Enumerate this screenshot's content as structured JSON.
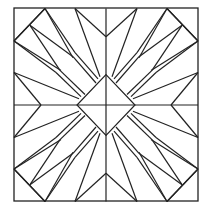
{
  "diagram": {
    "title": "",
    "stroke_color": "#222222",
    "background": "#ffffff",
    "frame": {
      "x": 14,
      "y": 8,
      "w": 184,
      "h": 193
    },
    "center": {
      "x": 106,
      "y": 105
    },
    "diamond_half": 29,
    "octant_segments": [
      [
        [
          -61,
          -92
        ],
        [
          -92,
          -61
        ]
      ],
      [
        [
          -31,
          -92
        ],
        [
          0,
          -65
        ]
      ],
      [
        [
          -31,
          -92
        ],
        [
          -6,
          -27
        ]
      ],
      [
        [
          -61,
          -92
        ],
        [
          -31,
          -50
        ]
      ],
      [
        [
          -31,
          -50
        ],
        [
          -8,
          -25
        ]
      ],
      [
        [
          -76,
          -76
        ],
        [
          -46,
          -33
        ]
      ],
      [
        [
          -46,
          -33
        ],
        [
          -21,
          -10
        ]
      ],
      [
        [
          -92,
          -61
        ],
        [
          -45,
          -33
        ]
      ]
    ],
    "axis_lines": true
  }
}
